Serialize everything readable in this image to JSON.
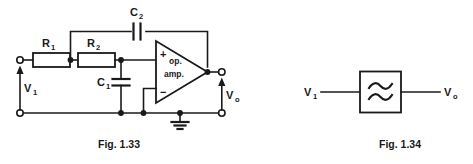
{
  "figures": [
    {
      "id": "fig-1-33",
      "caption": "Fig. 1.33",
      "description": "Active low-pass Sallen-Key filter built from an operational amplifier",
      "components": [
        {
          "name": "R1",
          "type": "resistor",
          "label": "R",
          "subscript": "1"
        },
        {
          "name": "R2",
          "type": "resistor",
          "label": "R",
          "subscript": "2"
        },
        {
          "name": "C1",
          "type": "capacitor",
          "label": "C",
          "subscript": "1"
        },
        {
          "name": "C2",
          "type": "capacitor",
          "label": "C",
          "subscript": "2"
        },
        {
          "name": "opamp",
          "type": "operational-amplifier",
          "label_line1": "op.",
          "label_line2": "amp.",
          "plus": "+",
          "minus": "−"
        },
        {
          "name": "ground",
          "type": "ground-symbol"
        }
      ],
      "ports": [
        {
          "name": "input",
          "label": "V",
          "subscript": "1"
        },
        {
          "name": "output",
          "label": "V",
          "subscript": "o"
        }
      ]
    },
    {
      "id": "fig-1-34",
      "caption": "Fig. 1.34",
      "description": "Generic filter block diagram",
      "components": [
        {
          "name": "filter-block",
          "type": "filter-block",
          "symbol": "wave-filter-glyph"
        }
      ],
      "ports": [
        {
          "name": "input",
          "label": "V",
          "subscript": "1"
        },
        {
          "name": "output",
          "label": "V",
          "subscript": "o"
        }
      ]
    }
  ],
  "colors": {
    "ink": "#1a1a1a",
    "paper": "#ffffff"
  }
}
